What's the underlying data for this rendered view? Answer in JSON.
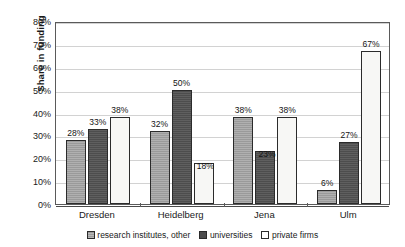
{
  "chart_data": {
    "type": "bar",
    "title": "",
    "xlabel": "",
    "ylabel": "Share in funding",
    "ylim": [
      0,
      80
    ],
    "ytick_step": 10,
    "ytick_labels": [
      "0%",
      "10%",
      "20%",
      "30%",
      "40%",
      "50%",
      "60%",
      "70%",
      "80%"
    ],
    "ytick_values": [
      0,
      10,
      20,
      30,
      40,
      50,
      60,
      70,
      80
    ],
    "grid": true,
    "grid_axis": "y",
    "legend_position": "bottom",
    "value_suffix": "%",
    "categories": [
      "Dresden",
      "Heidelberg",
      "Jena",
      "Ulm"
    ],
    "series": [
      {
        "name": "research institutes, other",
        "color": "#9a9a9a",
        "values": [
          28,
          32,
          38,
          6
        ],
        "labels": [
          "28%",
          "32%",
          "38%",
          "6%"
        ]
      },
      {
        "name": "universities",
        "color": "#4d4d4d",
        "values": [
          33,
          50,
          23,
          27
        ],
        "labels": [
          "33%",
          "50%",
          "23%",
          "27%"
        ]
      },
      {
        "name": "private firms",
        "color": "#ffffff",
        "values": [
          38,
          18,
          38,
          67
        ],
        "labels": [
          "38%",
          "18%",
          "38%",
          "67%"
        ]
      }
    ]
  },
  "colors": {
    "series_0": "#9a9a9a",
    "series_1": "#4d4d4d",
    "series_2": "#ffffff",
    "bar_border": "#2b2b2b",
    "gridline": "#d2d2d2",
    "axis": "#5a5a5a",
    "text": "#1a1a1a",
    "background": "#ffffff"
  }
}
